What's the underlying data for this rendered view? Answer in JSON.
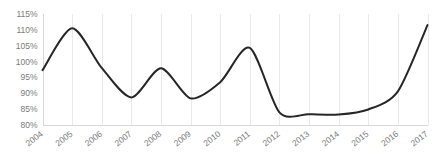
{
  "chart_data": {
    "type": "line",
    "title": "",
    "subtitle": "",
    "xlabel": "",
    "ylabel": "",
    "grid": "vertical",
    "legend": "none",
    "ylim": [
      80,
      115
    ],
    "ytick_labels": [
      "115%",
      "110%",
      "105%",
      "100%",
      "95%",
      "90%",
      "85%",
      "80%"
    ],
    "ytick_values": [
      115,
      110,
      105,
      100,
      95,
      90,
      85,
      80
    ],
    "categories": [
      "2004",
      "2005",
      "2006",
      "2007",
      "2008",
      "2009",
      "2010",
      "2011",
      "2012",
      "2013",
      "2014",
      "2015",
      "2016",
      "2017"
    ],
    "x": [
      2004,
      2005,
      2006,
      2007,
      2008,
      2009,
      2010,
      2011,
      2012,
      2013,
      2014,
      2015,
      2016,
      2017
    ],
    "values": [
      97.3,
      110.5,
      98.0,
      88.7,
      97.9,
      88.4,
      93.5,
      104.3,
      84.0,
      83.4,
      83.3,
      84.9,
      90.6,
      111.5
    ],
    "series": [
      {
        "name": "",
        "values": [
          97.3,
          110.5,
          98.0,
          88.7,
          97.9,
          88.4,
          93.5,
          104.3,
          84.0,
          83.4,
          83.3,
          84.9,
          90.6,
          111.5
        ]
      }
    ],
    "annotations": [],
    "line_color": "#262626",
    "gridline_color": "#e9e9e9",
    "axis_text_color": "#7a7a7a"
  }
}
